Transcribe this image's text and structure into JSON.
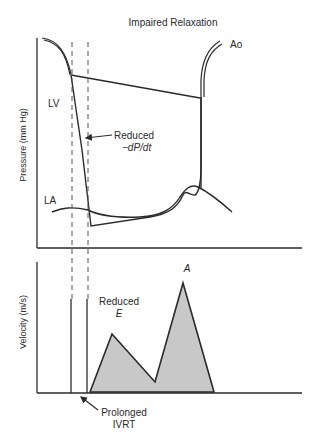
{
  "title": "Impaired Relaxation",
  "pressure_panel": {
    "ylabel": "Pressure (mm Hg)",
    "labels": {
      "lv": "LV",
      "la": "LA",
      "ao": "Ao",
      "annotation_line1": "Reduced",
      "annotation_line2": "−dP/dt"
    }
  },
  "velocity_panel": {
    "ylabel": "Velocity (m/s)",
    "labels": {
      "a_wave": "A",
      "e_line1": "Reduced",
      "e_line2": "E",
      "ivrt_line1": "Prolonged",
      "ivrt_line2": "IVRT"
    },
    "fill_color": "#c8c8c8"
  },
  "colors": {
    "stroke": "#2a2a2a",
    "dashed": "#555555"
  }
}
